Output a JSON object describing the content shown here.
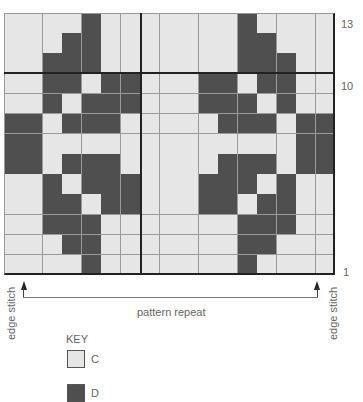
{
  "chart_data": {
    "type": "table",
    "columns": 17,
    "rows": 13,
    "row_labels": [
      {
        "row": 13,
        "label": "13"
      },
      {
        "row": 10,
        "label": "10"
      },
      {
        "row": 1,
        "label": "1"
      }
    ],
    "legend": [
      {
        "code": "C",
        "color": "#e6e6e6"
      },
      {
        "code": "D",
        "color": "#4f4f4f"
      }
    ],
    "annotations": [
      "edge stitch",
      "pattern repeat",
      "edge stitch"
    ],
    "thick_lines": {
      "vertical_after_col": 7,
      "horizontal_below_row": 11
    },
    "grid_top_to_bottom": [
      "CCCCDCCCCCCCDCCCC",
      "CCCDDCCCCCCCDDCCC",
      "CCDDDCCCCCCCDDDCC",
      "CCDDCDDCCCDDCDDCC",
      "CCDCDDDCCCDDDCDCC",
      "DDCDDDCCCCCDDDCDD",
      "DDCCCCCCCCCCCCCDD",
      "DDCDDDCCCCCDDDCDD",
      "CCDCDDDCCCDDDCDCC",
      "CCDDCDDCCCDDCDDCC",
      "CCDDDCCCCCCCDDDCC",
      "CCCDDCCCCCCCDDCCC",
      "CCCCDCCCCCCCDCCCC"
    ]
  },
  "labels": {
    "row_13": "13",
    "row_10": "10",
    "row_1": "1",
    "edge_left": "edge stitch",
    "edge_right": "edge stitch",
    "pattern_repeat": "pattern repeat"
  },
  "key": {
    "title": "KEY",
    "items": [
      {
        "code": "C",
        "color": "#e6e6e6"
      },
      {
        "code": "D",
        "color": "#4f4f4f"
      }
    ]
  }
}
